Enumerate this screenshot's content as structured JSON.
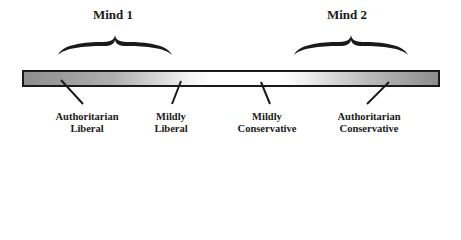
{
  "diagram": {
    "minds": [
      {
        "title": "Mind 1"
      },
      {
        "title": "Mind 2"
      }
    ],
    "spectrum_labels": [
      {
        "line1": "Authoritarian",
        "line2": "Liberal"
      },
      {
        "line1": "Mildly",
        "line2": "Liberal"
      },
      {
        "line1": "Mildly",
        "line2": "Conservative"
      },
      {
        "line1": "Authoritarian",
        "line2": "Conservative"
      }
    ],
    "colors": {
      "ink": "#1a1a1a",
      "bar_end": "#8e8e8e",
      "bar_center": "#ffffff"
    }
  }
}
